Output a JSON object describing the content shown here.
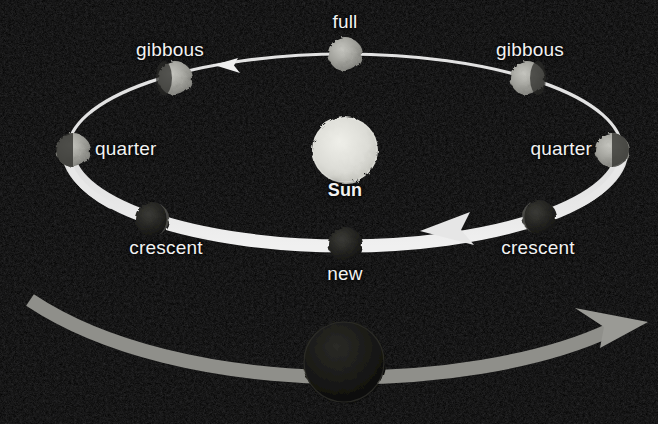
{
  "scene": {
    "title": "Moon phases orbital diagram",
    "background_color": "#050505",
    "width": 658,
    "height": 424
  },
  "sun": {
    "label": "Sun",
    "color": "#d9d9d3",
    "cx": 345,
    "cy": 150,
    "r": 33,
    "label_x": 345,
    "label_y": 181
  },
  "orbit": {
    "cx": 345,
    "cy": 150,
    "rx": 277,
    "ry": 96,
    "color": "#e6e6e6",
    "direction": "counterclockwise"
  },
  "phases": [
    {
      "name": "full",
      "label": "full",
      "cx": 345,
      "cy": 54,
      "r": 17,
      "fill": "#a8a8a4",
      "lit": 1.0,
      "lit_side": "all",
      "label_x": 345,
      "label_y": 12,
      "align": "center"
    },
    {
      "name": "gibbous-left",
      "label": "gibbous",
      "cx": 175,
      "cy": 78,
      "r": 17,
      "fill": "#9a9a96",
      "lit": 0.8,
      "lit_side": "right",
      "label_x": 170,
      "label_y": 40,
      "align": "center"
    },
    {
      "name": "gibbous-right",
      "label": "gibbous",
      "cx": 527,
      "cy": 78,
      "r": 17,
      "fill": "#9a9a96",
      "lit": 0.8,
      "lit_side": "left",
      "label_x": 530,
      "label_y": 40,
      "align": "center"
    },
    {
      "name": "quarter-left",
      "label": "quarter",
      "cx": 73,
      "cy": 150,
      "r": 17,
      "fill": "#8f8f8b",
      "lit": 0.5,
      "lit_side": "right",
      "label_x": 95,
      "label_y": 139,
      "align": "left"
    },
    {
      "name": "quarter-right",
      "label": "quarter",
      "cx": 612,
      "cy": 150,
      "r": 17,
      "fill": "#8f8f8b",
      "lit": 0.5,
      "lit_side": "left",
      "label_x": 592,
      "label_y": 139,
      "align": "right"
    },
    {
      "name": "crescent-left",
      "label": "crescent",
      "cx": 152,
      "cy": 219,
      "r": 17,
      "fill": "#2e2e2c",
      "lit": 0.18,
      "lit_side": "right",
      "label_x": 166,
      "label_y": 238,
      "align": "center"
    },
    {
      "name": "crescent-right",
      "label": "crescent",
      "cx": 539,
      "cy": 217,
      "r": 17,
      "fill": "#2e2e2c",
      "lit": 0.18,
      "lit_side": "left",
      "label_x": 538,
      "label_y": 238,
      "align": "center"
    },
    {
      "name": "new",
      "label": "new",
      "cx": 345,
      "cy": 244,
      "r": 17,
      "fill": "#232321",
      "lit": 0.0,
      "lit_side": "none",
      "label_x": 345,
      "label_y": 264,
      "align": "center"
    }
  ],
  "bottom_path": {
    "name": "earth-orbit-arrow",
    "color": "#9a9a96",
    "direction": "right",
    "moon": {
      "cx": 344,
      "cy": 362,
      "r": 40,
      "fill": "#141412"
    }
  },
  "arrowheads": [
    {
      "name": "orbit-arrow-upper-left",
      "points_to": "left"
    },
    {
      "name": "orbit-arrow-lower-right",
      "points_to": "left"
    },
    {
      "name": "bottom-arrow-right",
      "points_to": "right"
    }
  ]
}
